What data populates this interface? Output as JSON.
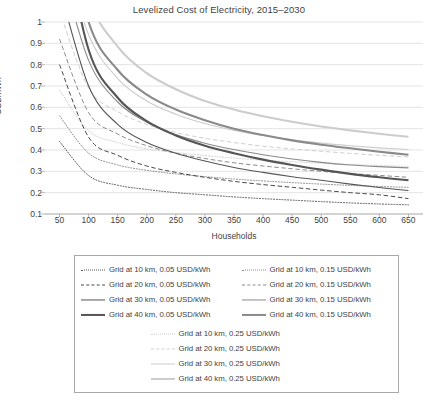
{
  "chart_data": {
    "type": "line",
    "title": "Levelized Cost of Electricity, 2015–2030",
    "xlabel": "Households",
    "ylabel": "USD/kWh",
    "xlim": [
      25,
      675
    ],
    "ylim": [
      0.1,
      1.0
    ],
    "grid": "horizontal",
    "legend_position": "below-plot",
    "x": [
      50,
      100,
      150,
      200,
      250,
      300,
      350,
      400,
      450,
      500,
      550,
      600,
      650
    ],
    "xticks": [
      50,
      100,
      150,
      200,
      250,
      300,
      350,
      400,
      450,
      500,
      550,
      600,
      650
    ],
    "yticks": [
      0.1,
      0.2,
      0.3,
      0.4,
      0.5,
      0.6,
      0.7,
      0.8,
      0.9,
      1
    ],
    "ytick_labels": [
      "0.1",
      "0.2",
      "0.3",
      "0.4",
      "0.5",
      "0.6",
      "0.7",
      "0.8",
      "0.9",
      "1"
    ],
    "series": [
      {
        "name": "Grid at 10 km, 0.05 USD/kWh",
        "style": "dotted",
        "color": "#595959",
        "width": 1.0,
        "values": [
          0.44,
          0.28,
          0.235,
          0.215,
          0.2,
          0.19,
          0.18,
          0.172,
          0.165,
          0.158,
          0.152,
          0.147,
          0.143
        ]
      },
      {
        "name": "Grid at 20 km, 0.05 USD/kWh",
        "style": "dashed",
        "color": "#4a4a4a",
        "width": 1.0,
        "values": [
          0.8,
          0.46,
          0.375,
          0.325,
          0.295,
          0.272,
          0.253,
          0.238,
          0.225,
          0.212,
          0.2,
          0.19,
          0.172
        ]
      },
      {
        "name": "Grid at 30 km, 0.05 USD/kWh",
        "style": "solid",
        "color": "#555555",
        "width": 1.1,
        "values": [
          1.16,
          0.7,
          0.52,
          0.435,
          0.385,
          0.348,
          0.318,
          0.295,
          0.275,
          0.258,
          0.24,
          0.224,
          0.21
        ]
      },
      {
        "name": "Grid at 40 km, 0.05 USD/kWh",
        "style": "solid",
        "color": "#555555",
        "width": 2.1,
        "values": [
          1.5,
          0.87,
          0.645,
          0.535,
          0.468,
          0.42,
          0.385,
          0.355,
          0.33,
          0.308,
          0.288,
          0.272,
          0.258
        ]
      },
      {
        "name": "Grid at 10 km, 0.15 USD/kWh",
        "style": "dotted",
        "color": "#8c8c8c",
        "width": 1.0,
        "values": [
          0.56,
          0.385,
          0.33,
          0.305,
          0.288,
          0.275,
          0.264,
          0.255,
          0.247,
          0.24,
          0.234,
          0.229,
          0.225
        ]
      },
      {
        "name": "Grid at 20 km, 0.15 USD/kWh",
        "style": "dashed",
        "color": "#8c8c8c",
        "width": 1.0,
        "values": [
          0.92,
          0.575,
          0.475,
          0.42,
          0.385,
          0.36,
          0.34,
          0.325,
          0.312,
          0.3,
          0.29,
          0.281,
          0.272
        ]
      },
      {
        "name": "Grid at 30 km, 0.15 USD/kWh",
        "style": "solid",
        "color": "#8a8a8a",
        "width": 1.1,
        "values": [
          1.28,
          0.82,
          0.625,
          0.53,
          0.472,
          0.432,
          0.402,
          0.378,
          0.358,
          0.342,
          0.33,
          0.322,
          0.316
        ]
      },
      {
        "name": "Grid at 40 km, 0.15 USD/kWh",
        "style": "solid",
        "color": "#8a8a8a",
        "width": 2.1,
        "values": [
          1.62,
          1.0,
          0.775,
          0.66,
          0.59,
          0.54,
          0.5,
          0.47,
          0.445,
          0.425,
          0.408,
          0.392,
          0.378
        ]
      },
      {
        "name": "Grid at 10 km, 0.25 USD/kWh",
        "style": "dotted",
        "color": "#cfcfcf",
        "width": 1.0,
        "values": [
          0.68,
          0.49,
          0.435,
          0.405,
          0.388,
          0.374,
          0.362,
          0.352,
          0.345,
          0.338,
          0.332,
          0.327,
          0.323
        ]
      },
      {
        "name": "Grid at 20 km, 0.25 USD/kWh",
        "style": "dashed",
        "color": "#cfcfcf",
        "width": 1.0,
        "values": [
          1.05,
          0.69,
          0.58,
          0.52,
          0.482,
          0.455,
          0.435,
          0.418,
          0.405,
          0.394,
          0.384,
          0.375,
          0.368
        ]
      },
      {
        "name": "Grid at 30 km, 0.25 USD/kWh",
        "style": "solid",
        "color": "#cccccc",
        "width": 1.1,
        "values": [
          1.4,
          0.94,
          0.735,
          0.63,
          0.568,
          0.524,
          0.492,
          0.468,
          0.448,
          0.432,
          0.42,
          0.41,
          0.402
        ]
      },
      {
        "name": "Grid at 40 km, 0.25 USD/kWh",
        "style": "solid",
        "color": "#cccccc",
        "width": 2.1,
        "values": [
          1.74,
          1.12,
          0.885,
          0.76,
          0.685,
          0.63,
          0.59,
          0.558,
          0.532,
          0.51,
          0.492,
          0.476,
          0.462
        ]
      }
    ]
  },
  "legend": {
    "columns": [
      {
        "items": [
          {
            "label": "Grid at 10 km, 0.05 USD/kWh",
            "series": 0
          },
          {
            "label": "Grid at 20 km, 0.05 USD/kWh",
            "series": 1
          },
          {
            "label": "Grid at 30 km, 0.05 USD/kWh",
            "series": 2
          },
          {
            "label": "Grid at 40 km, 0.05 USD/kWh",
            "series": 3
          }
        ]
      },
      {
        "items": [
          {
            "label": "Grid at 10 km, 0.15 USD/kWh",
            "series": 4
          },
          {
            "label": "Grid at 20 km, 0.15 USD/kWh",
            "series": 5
          },
          {
            "label": "Grid at 30 km, 0.15 USD/kWh",
            "series": 6
          },
          {
            "label": "Grid at 40 km, 0.15 USD/kWh",
            "series": 7
          }
        ]
      }
    ],
    "bottom_group": {
      "items": [
        {
          "label": "Grid at 10 km, 0.25 USD/kWh",
          "series": 8
        },
        {
          "label": "Grid at 20 km, 0.25 USD/kWh",
          "series": 9
        },
        {
          "label": "Grid at 30 km, 0.25 USD/kWh",
          "series": 10
        },
        {
          "label": "Grid at 40 km, 0.25 USD/kWh",
          "series": 11
        }
      ]
    }
  },
  "style": {
    "gridline_color": "#d9d9d9",
    "axis_color": "#a6a6a6",
    "text_color": "#3f3f3f",
    "legend_border": "#a8a8a8",
    "background": "#ffffff"
  }
}
